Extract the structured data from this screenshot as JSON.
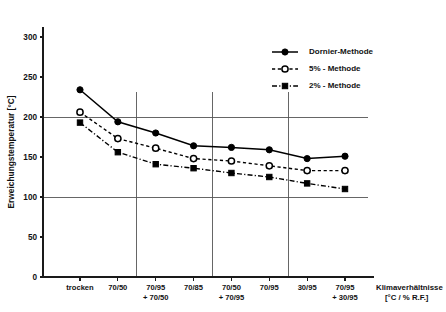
{
  "chart_data": {
    "type": "line",
    "title": "",
    "xlabel": "Klimaverhältnisse [°C / % R.F.]",
    "ylabel": "Erweichungstemperatur [°C]",
    "categories": [
      "trocken",
      "70/50",
      "70/95\n+ 70/50",
      "70/85",
      "70/50\n+ 70/95",
      "70/95",
      "30/95",
      "70/95\n+ 30/95"
    ],
    "category_lines": [
      [
        "trocken",
        ""
      ],
      [
        "70/50",
        ""
      ],
      [
        "70/95",
        "+ 70/50"
      ],
      [
        "70/85",
        ""
      ],
      [
        "70/50",
        "+ 70/95"
      ],
      [
        "70/95",
        ""
      ],
      [
        "30/95",
        ""
      ],
      [
        "70/95",
        "+ 30/95"
      ]
    ],
    "ylim": [
      0,
      320
    ],
    "yticks": [
      0,
      50,
      100,
      150,
      200,
      250,
      300
    ],
    "ytick_labels": [
      "0",
      "50",
      "100",
      "150",
      "200",
      "250",
      "300"
    ],
    "grid": "horizontal gridlines at 100 and 200; vertical gridlines after categories 2, 4 and 6",
    "hgrid_values": [
      100,
      200
    ],
    "vgrid_after_index": [
      1,
      3,
      5
    ],
    "legend_position": "top-right",
    "series": [
      {
        "name": "Dornier-Methode",
        "marker": "filled-circle",
        "linestyle": "solid",
        "values": [
          234,
          194,
          180,
          164,
          162,
          159,
          148,
          151
        ]
      },
      {
        "name": "5% - Methode",
        "marker": "open-circle",
        "linestyle": "dashed",
        "values": [
          206,
          173,
          161,
          148,
          145,
          139,
          133,
          133
        ]
      },
      {
        "name": "2% - Methode",
        "marker": "filled-square",
        "linestyle": "dashdot",
        "values": [
          193,
          156,
          141,
          136,
          130,
          125,
          117,
          110
        ]
      }
    ]
  },
  "axis_title_lines": [
    "Klimaverhältnisse",
    "[°C / % R.F.]"
  ],
  "legend": {
    "items": [
      {
        "label": "Dornier-Methode",
        "marker": "filled-circle",
        "linestyle": "solid"
      },
      {
        "label": "5% - Methode",
        "marker": "open-circle",
        "linestyle": "dashed"
      },
      {
        "label": "2% - Methode",
        "marker": "filled-square",
        "linestyle": "dashdot"
      }
    ]
  },
  "colors": {
    "ink": "#000000",
    "grid": "#555555",
    "background": "#ffffff"
  }
}
